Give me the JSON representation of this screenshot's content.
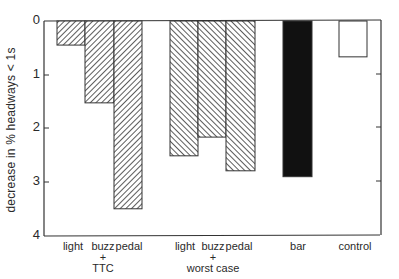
{
  "chart_data": {
    "type": "bar",
    "title": "",
    "xlabel": "",
    "ylabel": "decrease in % headways < 1s",
    "ylim": [
      0,
      4
    ],
    "y_inverted": true,
    "yticks": [
      "0",
      "1",
      "2",
      "3",
      "4"
    ],
    "grid": false,
    "categories": [
      "light",
      "buzz",
      "pedal",
      "light",
      "buzz",
      "pedal",
      "bar",
      "control"
    ],
    "groups": [
      {
        "name": "TTC",
        "label_lines": [
          "+",
          "TTC"
        ],
        "categories": [
          "light",
          "buzz",
          "pedal"
        ],
        "values": [
          0.45,
          1.53,
          3.51
        ],
        "fill": "hatch-right"
      },
      {
        "name": "worst case",
        "label_lines": [
          "+",
          "worst case"
        ],
        "categories": [
          "light",
          "buzz",
          "pedal"
        ],
        "values": [
          2.52,
          2.17,
          2.8
        ],
        "fill": "hatch-left"
      },
      {
        "name": "bar",
        "categories": [
          "bar"
        ],
        "values": [
          2.91
        ],
        "fill": "solid-black"
      },
      {
        "name": "control",
        "categories": [
          "control"
        ],
        "values": [
          0.67
        ],
        "fill": "white"
      }
    ],
    "values": [
      0.45,
      1.53,
      3.51,
      2.52,
      2.17,
      2.8,
      2.91,
      0.67
    ]
  },
  "labels": {
    "ylabel": "decrease in % headways < 1s",
    "yticks": [
      "0",
      "1",
      "2",
      "3",
      "4"
    ],
    "x": [
      "light",
      "buzz",
      "pedal",
      "light",
      "buzz",
      "pedal",
      "bar",
      "control"
    ],
    "plus1": "+",
    "ttc": "TTC",
    "plus2": "+",
    "worst": "worst case"
  }
}
